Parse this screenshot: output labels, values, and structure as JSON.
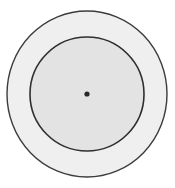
{
  "diagram": {
    "type": "concentric-circles",
    "width": 175,
    "height": 188,
    "center": {
      "x": 87,
      "y": 94
    },
    "outer_circle": {
      "rx": 80,
      "ry": 83,
      "fill": "#efefef",
      "stroke": "#3c3c3c",
      "stroke_width": 1.4
    },
    "inner_circle": {
      "r": 57,
      "fill": "#e3e3e3",
      "stroke": "#2f2f2f",
      "stroke_width": 1.6
    },
    "center_dot": {
      "r": 2.6,
      "fill": "#2a2a2a"
    },
    "background": "#ffffff"
  }
}
